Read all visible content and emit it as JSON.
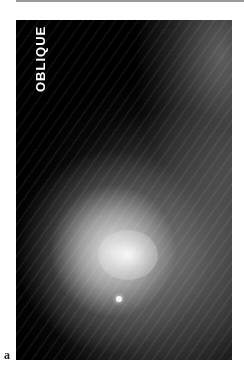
{
  "figure": {
    "view_label": "OBLIQUE",
    "panel_label": "a",
    "colors": {
      "background": "#000000",
      "label_text": "#ffffff",
      "rule": "#9a9a9a"
    }
  }
}
